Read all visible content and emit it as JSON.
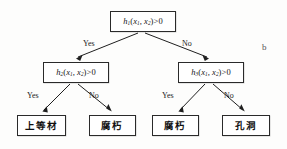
{
  "figure": {
    "label": "b",
    "type": "decision-tree"
  },
  "nodes": {
    "root": {
      "id": "h1",
      "fn": "h",
      "sub": "1",
      "args_open": "(",
      "arg1": "x",
      "arg1_sub": "1",
      "comma": ", ",
      "arg2": "x",
      "arg2_sub": "2",
      "args_close": ")",
      "compare": ">0",
      "text": "h1(x1, x2)>0"
    },
    "left": {
      "id": "h2",
      "fn": "h",
      "sub": "2",
      "args_open": "(",
      "arg1": "x",
      "arg1_sub": "1",
      "comma": ", ",
      "arg2": "x",
      "arg2_sub": "2",
      "args_close": ")",
      "compare": ">0",
      "text": "h2(x1, x2)>0"
    },
    "right": {
      "id": "h3",
      "fn": "h",
      "sub": "3",
      "args_open": "(",
      "arg1": "x",
      "arg1_sub": "1",
      "comma": ", ",
      "arg2": "x",
      "arg2_sub": "2",
      "args_close": ")",
      "compare": ">0",
      "text": "h3(x1, x2)>0"
    }
  },
  "leaves": [
    {
      "key": "leaf1",
      "label": "上等材"
    },
    {
      "key": "leaf2",
      "label": "腐朽"
    },
    {
      "key": "leaf3",
      "label": "腐朽"
    },
    {
      "key": "leaf4",
      "label": "孔洞"
    }
  ],
  "edges": {
    "root_yes": "Yes",
    "root_no": "No",
    "h2_yes": "Yes",
    "h2_no": "No",
    "h3_yes": "Yes",
    "h3_no": "No"
  },
  "colors": {
    "background": "#fdfdfc",
    "box_border": "#2a2a2a",
    "box_fill": "#ffffff",
    "edge_stroke": "#1f1f1f",
    "text": "#151515",
    "fig_label": "#555555"
  }
}
